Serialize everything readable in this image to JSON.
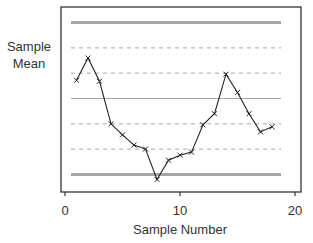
{
  "chart_data": {
    "type": "line",
    "title": "",
    "xlabel": "Sample Number",
    "ylabel": "Sample Mean",
    "ylabel_lines": [
      "Sample",
      "Mean"
    ],
    "xlim": [
      0,
      20
    ],
    "x_ticks": [
      0,
      10,
      20
    ],
    "x_tick_labels": [
      "0",
      "10",
      "20"
    ],
    "y_ticks_shown": false,
    "grid": false,
    "legend": null,
    "control_lines": {
      "units": "sigma from center",
      "ucl": 3,
      "plus_2sigma": 2,
      "plus_1sigma": 1,
      "center": 0,
      "minus_1sigma": -1,
      "minus_2sigma": -2,
      "lcl": -3,
      "ucl_lcl_style": "thick solid gray",
      "center_style": "thin solid gray",
      "sigma_style": "dashed gray"
    },
    "x": [
      1,
      2,
      3,
      4,
      5,
      6,
      7,
      8,
      9,
      10,
      11,
      12,
      13,
      14,
      15,
      16,
      17,
      18
    ],
    "series": [
      {
        "name": "Sample Mean",
        "marker": "x",
        "values": [
          0.72,
          1.6,
          0.68,
          -1.0,
          -1.44,
          -1.84,
          -2.0,
          -3.2,
          -2.44,
          -2.24,
          -2.12,
          -1.04,
          -0.6,
          0.96,
          0.24,
          -0.6,
          -1.32,
          -1.12
        ]
      }
    ]
  },
  "colors": {
    "line": "#222222",
    "control": "#a6a6a6",
    "frame": "#333333"
  }
}
